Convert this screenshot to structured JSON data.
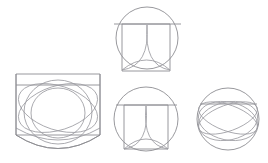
{
  "document": {
    "title": "Geometric line figures",
    "background_color": "#ffffff",
    "stroke_color": "#8d8d92",
    "stroke_color_secondary": "#9b9ba0",
    "stroke_width": 0.9,
    "width": 268,
    "height": 163,
    "figure_count": 4
  },
  "figures": [
    {
      "id": "figure-top",
      "name": "circle-square-petal-top",
      "description": "Circle with an inscribed square extending below the circle, a horizontal chord crossing the full circle width, and two crossing arcs forming a pointed petal inside the square.",
      "position": {
        "x": 113,
        "y": 7
      },
      "size": {
        "width": 67,
        "height": 70
      },
      "circle": {
        "cx": 147,
        "cy": 38,
        "r": 31
      },
      "square": {
        "x": 122,
        "y": 24,
        "width": 48,
        "height": 47
      },
      "chord": {
        "x1": 114,
        "y1": 24,
        "x2": 181,
        "y2": 24
      },
      "arcs": [
        {
          "name": "petal-arc-left",
          "d": "M 122 70 Q 150 66 147 25"
        },
        {
          "name": "petal-arc-right",
          "d": "M 170 70 Q 144 66 147 25"
        },
        {
          "name": "petal-base-arc",
          "d": "M 122 70 Q 147 50 170 70"
        }
      ]
    },
    {
      "id": "figure-left",
      "name": "rounded-square-multi-ellipse",
      "description": "Large rounded-bottom square panel overlaid with several large intersecting ellipses and arcs, plus horizontal chord lines near the top and bottom.",
      "position": {
        "x": 14,
        "y": 72
      },
      "size": {
        "width": 88,
        "height": 85
      },
      "square": {
        "x": 16,
        "y": 74,
        "width": 84,
        "height": 70
      },
      "chords": [
        {
          "name": "chord-upper",
          "x1": 16,
          "y1": 85,
          "x2": 100,
          "y2": 85
        },
        {
          "name": "chord-lower",
          "x1": 16,
          "y1": 135,
          "x2": 100,
          "y2": 135
        }
      ],
      "ellipses": [
        {
          "name": "ellipse-center",
          "cx": 58,
          "cy": 112,
          "rx": 34,
          "ry": 32
        },
        {
          "name": "ellipse-inner",
          "cx": 58,
          "cy": 113,
          "rx": 27,
          "ry": 25
        },
        {
          "name": "ellipse-tilt-left",
          "cx": 58,
          "cy": 108,
          "rx": 41,
          "ry": 22,
          "rotate": 18
        },
        {
          "name": "ellipse-tilt-right",
          "cx": 58,
          "cy": 108,
          "rx": 41,
          "ry": 22,
          "rotate": -18
        }
      ],
      "bottom_arcs": [
        {
          "name": "bottom-arc-outer",
          "d": "M 16 135 Q 58 162 100 135"
        },
        {
          "name": "bottom-arc-inner",
          "d": "M 16 128 Q 58 152 100 128"
        }
      ]
    },
    {
      "id": "figure-mid-bottom",
      "name": "circle-square-petal-bottom",
      "description": "Circle containing a square whose bottom corners meet the circle, a horizontal chord across the circle, and two crossing arcs forming a petal inside the square.",
      "position": {
        "x": 114,
        "y": 85
      },
      "size": {
        "width": 64,
        "height": 68
      },
      "circle": {
        "cx": 146,
        "cy": 119,
        "r": 32
      },
      "square": {
        "x": 124,
        "y": 105,
        "width": 44,
        "height": 44
      },
      "chord": {
        "x1": 116,
        "y1": 105,
        "x2": 177,
        "y2": 105
      },
      "arcs": [
        {
          "name": "petal-arc-left",
          "d": "M 124 149 Q 150 145 146 106"
        },
        {
          "name": "petal-arc-right",
          "d": "M 168 149 Q 142 145 146 106"
        },
        {
          "name": "petal-base-arc",
          "d": "M 124 149 Q 146 129 168 149"
        }
      ]
    },
    {
      "id": "figure-right",
      "name": "circle-crossing-ellipses",
      "description": "Circle crossed by a horizontal chord near the top and four long tilted elliptical arcs that intersect in a woven lattice pattern.",
      "position": {
        "x": 197,
        "y": 85
      },
      "size": {
        "width": 62,
        "height": 68
      },
      "circle": {
        "cx": 228,
        "cy": 119,
        "r": 31
      },
      "chord": {
        "x1": 200,
        "y1": 104,
        "x2": 257,
        "y2": 104
      },
      "ellipses": [
        {
          "name": "lattice-ellipse-a",
          "cx": 228,
          "cy": 118,
          "rx": 31,
          "ry": 13,
          "rotate": 20
        },
        {
          "name": "lattice-ellipse-b",
          "cx": 228,
          "cy": 118,
          "rx": 31,
          "ry": 13,
          "rotate": -20
        },
        {
          "name": "lattice-ellipse-c",
          "cx": 228,
          "cy": 121,
          "rx": 30,
          "ry": 19,
          "rotate": 12
        },
        {
          "name": "lattice-ellipse-d",
          "cx": 228,
          "cy": 121,
          "rx": 30,
          "ry": 19,
          "rotate": -12
        }
      ]
    }
  ]
}
